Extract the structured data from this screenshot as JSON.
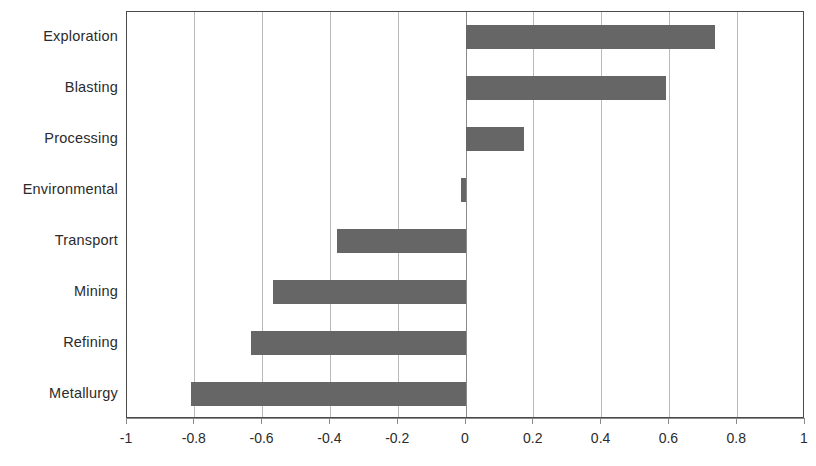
{
  "chart_data": {
    "type": "bar",
    "orientation": "horizontal",
    "title": "",
    "subtitle": "",
    "xlabel": "",
    "ylabel": "",
    "categories": [
      "Exploration",
      "Blasting",
      "Processing",
      "Environmental",
      "Transport",
      "Mining",
      "Refining",
      "Metallurgy"
    ],
    "values": [
      0.735,
      0.59,
      0.17,
      -0.015,
      -0.38,
      -0.57,
      -0.635,
      -0.81
    ],
    "xlim": [
      -1,
      1
    ],
    "xticks": [
      -1,
      -0.8,
      -0.6,
      -0.4,
      -0.2,
      0,
      0.2,
      0.4,
      0.6,
      0.8,
      1
    ],
    "xtick_labels": [
      "-1",
      "-0.8",
      "-0.6",
      "-0.4",
      "-0.2",
      "0",
      "0.2",
      "0.4",
      "0.6",
      "0.8",
      "1"
    ],
    "grid": true,
    "grid_axis": "x",
    "legend": false,
    "legend_position": "none",
    "bar_color": "#666666",
    "gridline_color": "#b9b9b9",
    "zero_line_color": "#8a8a8a",
    "plot_border_color": "#4a4a4a",
    "background_color": "#ffffff",
    "text_color": "#2b2b2b",
    "series": [
      {
        "name": "",
        "values": [
          0.735,
          0.59,
          0.17,
          -0.015,
          -0.38,
          -0.57,
          -0.635,
          -0.81
        ]
      }
    ]
  }
}
